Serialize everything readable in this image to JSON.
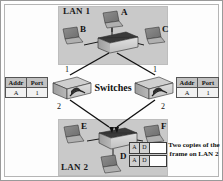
{
  "figure": {
    "type": "network-diagram"
  },
  "lans": [
    {
      "id": "lan1",
      "label": "LAN 1",
      "hosts": [
        "A",
        "B",
        "C"
      ]
    },
    {
      "id": "lan2",
      "label": "LAN 2",
      "hosts": [
        "E",
        "F",
        "D"
      ]
    }
  ],
  "hosts": {
    "a": "A",
    "b": "B",
    "c": "C",
    "d": "D",
    "e": "E",
    "f": "F"
  },
  "switches": {
    "label": "Switches",
    "left": {
      "port_top": "1",
      "port_bottom": "2"
    },
    "right": {
      "port_top": "1",
      "port_bottom": "2"
    }
  },
  "address_tables": {
    "headers": [
      "Addr",
      "Port"
    ],
    "left": {
      "addr": "A",
      "port": "1"
    },
    "right": {
      "addr": "A",
      "port": "1"
    }
  },
  "frames": [
    {
      "dest": "A",
      "src": "D",
      "payload": ""
    },
    {
      "dest": "A",
      "src": "D",
      "payload": ""
    }
  ],
  "caption": "Two copies of the frame on LAN 2",
  "colors": {
    "lan_panel": "#c9c9c9",
    "device_body": "#a8a8a8",
    "device_top": "#d4d4d4",
    "line": "#111111",
    "frame_cell": "#d0d0d0",
    "table_header": "#c2c2c2"
  }
}
